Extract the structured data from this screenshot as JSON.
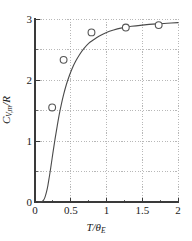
{
  "chart_data": {
    "type": "scatter",
    "title": "",
    "xlabel": "T/θ_E",
    "ylabel": "C_V,m/R",
    "xlim": [
      0,
      2
    ],
    "ylim": [
      0,
      3
    ],
    "grid": true,
    "legend": "none",
    "xticks": [
      0,
      0.5,
      1,
      1.5,
      2
    ],
    "xticklabels": [
      "0",
      "0.5",
      "1",
      "1.5",
      "2"
    ],
    "yticks": [
      0,
      1,
      2,
      3
    ],
    "yticklabels": [
      "0",
      "1",
      "2",
      "3"
    ],
    "minor_gridlines": [
      0.5
    ],
    "series": [
      {
        "name": "experimental points",
        "marker": "open-circle",
        "x": [
          0.24,
          0.4,
          0.79,
          1.27,
          1.73
        ],
        "y": [
          1.55,
          2.33,
          2.78,
          2.86,
          2.9
        ]
      },
      {
        "name": "Einstein model curve",
        "marker": "none",
        "x": [
          0.05,
          0.08,
          0.1,
          0.12,
          0.14,
          0.16,
          0.18,
          0.2,
          0.22,
          0.25,
          0.28,
          0.31,
          0.34,
          0.37,
          0.4,
          0.44,
          0.48,
          0.52,
          0.57,
          0.62,
          0.68,
          0.75,
          0.82,
          0.9,
          1.0,
          1.1,
          1.2,
          1.35,
          1.5,
          1.7,
          1.85,
          2.0
        ],
        "y": [
          0.0,
          0.0,
          0.01,
          0.03,
          0.08,
          0.16,
          0.27,
          0.41,
          0.56,
          0.8,
          1.03,
          1.24,
          1.44,
          1.61,
          1.76,
          1.93,
          2.07,
          2.19,
          2.31,
          2.41,
          2.51,
          2.6,
          2.66,
          2.72,
          2.78,
          2.82,
          2.85,
          2.88,
          2.9,
          2.92,
          2.93,
          2.94
        ]
      }
    ],
    "axis_color": "#3a3a3a",
    "grid_color": "#9a9a9a",
    "curve_color": "#4a4a4a",
    "marker_face_color": "#ffffff",
    "marker_edge_color": "#555555",
    "background_color": "#ffffff"
  },
  "axis_labels": {
    "x_symbol": "T/θ",
    "x_subscript": "E",
    "y_symbol_main": "C",
    "y_subscript": "V,m",
    "y_symbol_tail": "/R"
  }
}
